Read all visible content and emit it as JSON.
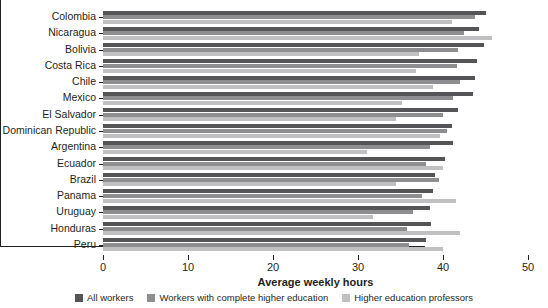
{
  "chart_data": {
    "type": "bar",
    "orientation": "horizontal",
    "title": "",
    "xlabel": "Average weekly hours",
    "ylabel": "",
    "xlim": [
      0,
      50
    ],
    "xticks": [
      0,
      10,
      20,
      30,
      40,
      50
    ],
    "grid": false,
    "legend_position": "bottom",
    "categories": [
      "Colombia",
      "Nicaragua",
      "Bolivia",
      "Costa Rica",
      "Chile",
      "Mexico",
      "El Salvador",
      "Dominican Republic",
      "Argentina",
      "Ecuador",
      "Brazil",
      "Panama",
      "Uruguay",
      "Honduras",
      "Peru"
    ],
    "series": [
      {
        "name": "All workers",
        "color": "#555457",
        "values": [
          45.0,
          44.2,
          44.8,
          44.0,
          43.8,
          43.5,
          41.8,
          41.0,
          41.2,
          40.2,
          39.0,
          38.8,
          38.5,
          38.6,
          38.0
        ]
      },
      {
        "name": "Workers with complete higher education",
        "color": "#8e8d90",
        "values": [
          43.8,
          42.5,
          41.8,
          41.6,
          42.0,
          41.2,
          40.0,
          40.5,
          38.5,
          38.0,
          39.5,
          37.5,
          36.5,
          35.8,
          36.0
        ]
      },
      {
        "name": "Higher education professors",
        "color": "#c0bfc1",
        "values": [
          41.0,
          45.8,
          37.2,
          36.8,
          38.8,
          35.2,
          34.5,
          39.6,
          31.0,
          40.0,
          34.5,
          41.5,
          31.8,
          42.0,
          40.0
        ]
      }
    ]
  },
  "legend": {
    "items": [
      {
        "label": "All workers",
        "color": "#555457",
        "swatch": "swatch-dark"
      },
      {
        "label": "Workers with complete higher education",
        "color": "#8e8d90",
        "swatch": "swatch-medium"
      },
      {
        "label": "Higher education professors",
        "color": "#c0bfc1",
        "swatch": "swatch-light"
      }
    ]
  }
}
